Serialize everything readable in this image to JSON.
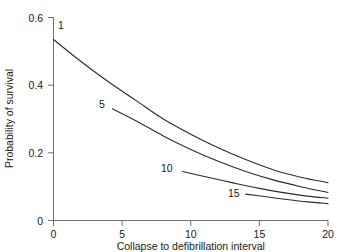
{
  "chart_data": {
    "type": "line",
    "title": "",
    "subtitle": "",
    "xlabel": "Collapse to defibrillation interval",
    "ylabel": "Probability of survival",
    "xlim": [
      0,
      20
    ],
    "ylim": [
      0,
      0.6
    ],
    "grid": false,
    "legend_position": "inline-curve-labels",
    "x_ticks": [
      "0",
      "5",
      "10",
      "15",
      "20"
    ],
    "x_tick_values": [
      0,
      5,
      10,
      15,
      20
    ],
    "y_ticks": [
      "0",
      "0.2",
      "0.4",
      "0.6"
    ],
    "y_tick_values": [
      0,
      0.2,
      0.4,
      0.6
    ],
    "series": [
      {
        "name": "1",
        "label": "1",
        "x": [
          0,
          2,
          4,
          6,
          8,
          10,
          12,
          14,
          16,
          18,
          20
        ],
        "values": [
          0.535,
          0.47,
          0.41,
          0.355,
          0.3,
          0.255,
          0.215,
          0.18,
          0.15,
          0.128,
          0.112
        ]
      },
      {
        "name": "5",
        "label": "5",
        "x": [
          4.3,
          6,
          8,
          10,
          12,
          14,
          16,
          18,
          20
        ],
        "values": [
          0.33,
          0.295,
          0.25,
          0.21,
          0.175,
          0.145,
          0.12,
          0.1,
          0.083
        ]
      },
      {
        "name": "10",
        "label": "10",
        "x": [
          9.4,
          11,
          13,
          15,
          17,
          18.5,
          20
        ],
        "values": [
          0.145,
          0.13,
          0.112,
          0.095,
          0.081,
          0.072,
          0.066
        ]
      },
      {
        "name": "15",
        "label": "15",
        "x": [
          14,
          15.5,
          17,
          18.5,
          20
        ],
        "values": [
          0.078,
          0.07,
          0.062,
          0.055,
          0.05
        ]
      }
    ],
    "annotations": [
      {
        "text": "1",
        "x_px": 58,
        "y_px": 29
      },
      {
        "text": "5",
        "x_px": 102,
        "y_px": 108
      },
      {
        "text": "10",
        "x_px": 164,
        "y_px": 172
      },
      {
        "text": "15",
        "x_px": 231,
        "y_px": 197
      }
    ],
    "colors": {
      "line": "#2b2b2b",
      "axis": "#707070",
      "text": "#1a1a1a",
      "background": "#ffffff"
    }
  }
}
